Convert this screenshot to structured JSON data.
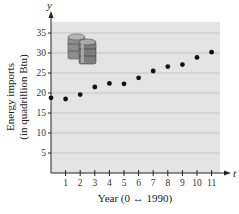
{
  "chart_data": {
    "type": "scatter",
    "title": "",
    "xlabel": "Year (0 ↔ 1990)",
    "ylabel_line1": "Energy imports",
    "ylabel_line2": "(in quadrillion Btu)",
    "x_axis_var": "t",
    "y_axis_var": "y",
    "x": [
      0,
      1,
      2,
      3,
      4,
      5,
      6,
      7,
      8,
      9,
      10,
      11
    ],
    "y": [
      18.8,
      18.5,
      19.6,
      21.5,
      22.4,
      22.3,
      23.8,
      25.5,
      26.6,
      27.1,
      28.9,
      30.2
    ],
    "x_ticks": [
      1,
      2,
      3,
      4,
      5,
      6,
      7,
      8,
      9,
      10,
      11
    ],
    "y_ticks": [
      5,
      10,
      15,
      20,
      25,
      30,
      35
    ],
    "xlim": [
      0,
      11.5
    ],
    "ylim": [
      0,
      38
    ],
    "grid": "horizontal",
    "plot_background": "#e4e4e4",
    "point_color": "#111111",
    "gridline_color": "#b8b8b8",
    "decoration": "oil-barrels-icon"
  }
}
